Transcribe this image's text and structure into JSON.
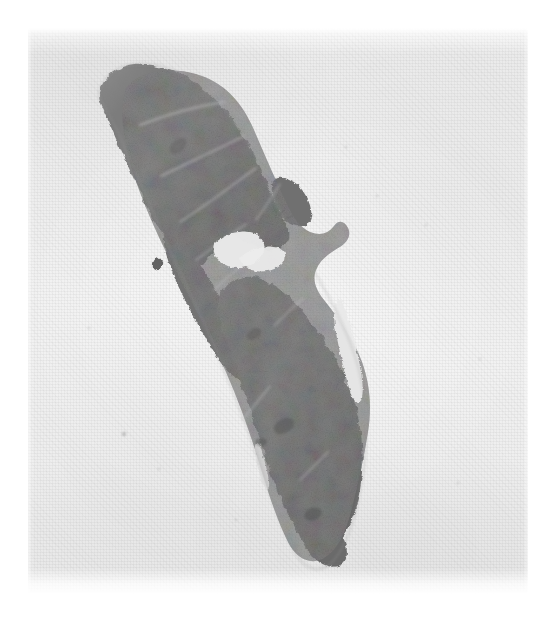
{
  "image": {
    "kind": "histopathology-slide-scan",
    "title": "Histology section scan",
    "modality": "light-microscopy-whole-slide",
    "stain_appearance": "grayscale",
    "canvas_width_px": 560,
    "canvas_height_px": 631,
    "orientation": "diagonal upper-left to lower-right"
  },
  "colors": {
    "page_white": "#ffffff",
    "slide_background": "#f1f1f1",
    "background_light": "#f7f7f7",
    "background_shadow": "#e6e6e6",
    "tissue_mid": "#7c7c7c",
    "tissue_dark": "#5e5e5e",
    "tissue_darkest": "#4a4a4a",
    "tissue_light": "#9a9a9a",
    "septa_streak": "#c9c9c9",
    "cleft_white": "#efefef"
  },
  "layout": {
    "margins": {
      "top_px": 28,
      "left_px": 28,
      "right_px": 32,
      "bottom_px": 36
    },
    "slide_field": {
      "x": 28,
      "y": 28,
      "width": 500,
      "height": 567
    }
  },
  "specimen": {
    "label": "tissue-section",
    "description": "Elongated bilobed tissue section running from upper-left to lower-right",
    "bounding_box": {
      "x": 70,
      "y": 42,
      "width": 300,
      "height": 500
    },
    "lobes": [
      {
        "name": "upper-lobe",
        "center_x": 175,
        "center_y": 130,
        "approx_width": 160,
        "approx_height": 190
      },
      {
        "name": "lower-lobe",
        "center_x": 300,
        "center_y": 400,
        "approx_width": 150,
        "approx_height": 230
      }
    ],
    "features": [
      {
        "name": "mid-cleft-notch",
        "x": 215,
        "y": 195,
        "width": 55,
        "height": 50
      },
      {
        "name": "detached-fragment",
        "x": 232,
        "y": 196,
        "width": 22,
        "height": 20
      },
      {
        "name": "right-margin-slit",
        "x": 332,
        "y": 282,
        "width": 12,
        "height": 95
      },
      {
        "name": "isolated-dark-fleck",
        "x": 126,
        "y": 232,
        "width": 9,
        "height": 11
      },
      {
        "name": "lower-tip",
        "x": 330,
        "y": 515,
        "width": 60,
        "height": 30
      }
    ],
    "internal_streaks": [
      {
        "name": "septum-1",
        "x1": 140,
        "y1": 125,
        "x2": 225,
        "y2": 85
      },
      {
        "name": "septum-2",
        "x1": 165,
        "y1": 175,
        "x2": 250,
        "y2": 120
      },
      {
        "name": "septum-3",
        "x1": 185,
        "y1": 225,
        "x2": 262,
        "y2": 165
      },
      {
        "name": "septum-4",
        "x1": 205,
        "y1": 275,
        "x2": 250,
        "y2": 235
      },
      {
        "name": "septum-5",
        "x1": 300,
        "y1": 322,
        "x2": 320,
        "y2": 296
      },
      {
        "name": "septum-6",
        "x1": 245,
        "y1": 430,
        "x2": 268,
        "y2": 400
      }
    ]
  },
  "paper_flecks": [
    {
      "x": 163,
      "y": 140,
      "r": 1.4
    },
    {
      "x": 318,
      "y": 119,
      "r": 1.2
    },
    {
      "x": 398,
      "y": 197,
      "r": 1.1
    },
    {
      "x": 452,
      "y": 331,
      "r": 1.3
    },
    {
      "x": 96,
      "y": 406,
      "r": 1.6
    },
    {
      "x": 131,
      "y": 441,
      "r": 1.3
    },
    {
      "x": 208,
      "y": 492,
      "r": 1.2
    },
    {
      "x": 349,
      "y": 168,
      "r": 1.0
    },
    {
      "x": 61,
      "y": 300,
      "r": 1.2
    },
    {
      "x": 430,
      "y": 455,
      "r": 1.1
    }
  ],
  "annotations": {
    "has_text_labels": false,
    "has_scale_bar": false,
    "has_ruler": false
  }
}
